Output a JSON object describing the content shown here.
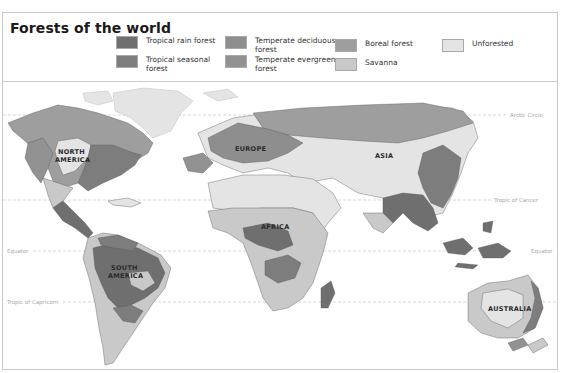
{
  "title": "Forests of the world",
  "legend": [
    {
      "label": "Tropical rain forest",
      "color": "#6f6f6f"
    },
    {
      "label": "Tropical seasonal forest",
      "color": "#7d7d7d"
    },
    {
      "label": "Temperate deciduous forest",
      "color": "#8e8e8e"
    },
    {
      "label": "Temperate evergreen forest",
      "color": "#929292"
    },
    {
      "label": "Boreal forest",
      "color": "#9e9e9e"
    },
    {
      "label": "Savanna",
      "color": "#c9c9c9"
    },
    {
      "label": "Unforested",
      "color": "#e4e4e4"
    }
  ],
  "latitude_lines": {
    "arctic": "Arctic Circle",
    "cancer": "Tropic of Cancer",
    "equator": "Equator",
    "capricorn": "Tropic of Capricorn"
  },
  "continents": {
    "north_america": [
      "NORTH",
      "AMERICA"
    ],
    "south_america": [
      "SOUTH",
      "AMERICA"
    ],
    "europe": "EUROPE",
    "asia": "ASIA",
    "africa": "AFRICA",
    "australia": "AUSTRALIA"
  }
}
